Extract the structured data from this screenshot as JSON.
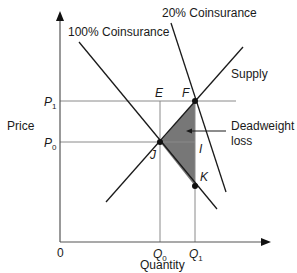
{
  "diagram": {
    "title": "",
    "axes": {
      "y_label": "Price",
      "x_label": "Quantity",
      "origin_label": "0"
    },
    "price_levels": [
      {
        "id": "P1",
        "main": "P",
        "sub": "1"
      },
      {
        "id": "P0",
        "main": "P",
        "sub": "0"
      }
    ],
    "quantity_levels": [
      {
        "id": "Q0",
        "main": "Q",
        "sub": "0"
      },
      {
        "id": "Q1",
        "main": "Q",
        "sub": "1"
      }
    ],
    "curves": {
      "demand_100": "100% Coinsurance",
      "demand_20": "20% Coinsurance",
      "supply": "Supply"
    },
    "points": {
      "E": "E",
      "F": "F",
      "I": "I",
      "J": "J",
      "K": "K"
    },
    "annotation": {
      "line1": "Deadweight",
      "line2": "loss"
    },
    "colors": {
      "line": "#1a1a1a",
      "guide": "#8a8a8a",
      "shade": "#777777"
    }
  }
}
